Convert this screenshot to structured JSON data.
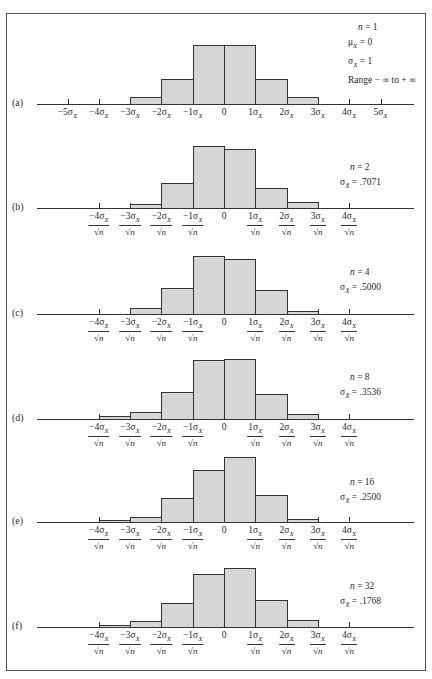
{
  "figure": {
    "frame_color": "#555555",
    "bar_fill": "#d6d6d6",
    "bar_stroke": "#333333",
    "axis_x_start": 37,
    "axis_x_end": 414,
    "zero_x": 224,
    "sigma_px": 31.3
  },
  "chart_data": [
    {
      "type": "bar",
      "panel": "(a)",
      "title": "n = 1",
      "annotations": [
        "n = 1",
        "μX = 0",
        "σX = 1",
        "Range −∞ to +∞"
      ],
      "xlabel": "",
      "ylabel": "",
      "bin_edges_sigma": [
        -3,
        -2,
        -1,
        0,
        1,
        2,
        3
      ],
      "values": [
        7,
        25,
        59,
        59,
        25,
        7
      ],
      "tick_labels": [
        "−5σX",
        "−4σX",
        "−3σX",
        "−2σX",
        "−1σX",
        "0",
        "1σX",
        "2σX",
        "3σX",
        "4σX",
        "5σX"
      ],
      "tick_positions_sigma": [
        -5,
        -4,
        -3,
        -2,
        -1,
        0,
        1,
        2,
        3,
        4,
        5
      ],
      "grid": false
    },
    {
      "type": "bar",
      "panel": "(b)",
      "annotations": [
        "n = 2",
        "σX̄ = .7071"
      ],
      "bin_edges_sigma": [
        -3,
        -2,
        -1,
        0,
        1,
        2,
        3
      ],
      "values": [
        4,
        25,
        62,
        59,
        20,
        6
      ],
      "tick_labels": [
        "−4σX/√n",
        "−3σX/√n",
        "−2σX/√n",
        "−1σX/√n",
        "0",
        "1σX/√n",
        "2σX/√n",
        "3σX/√n",
        "4σX/√n"
      ],
      "tick_positions_sigma": [
        -4,
        -3,
        -2,
        -1,
        0,
        1,
        2,
        3,
        4
      ],
      "grid": false
    },
    {
      "type": "bar",
      "panel": "(c)",
      "annotations": [
        "n = 4",
        "σX̄ = .5000"
      ],
      "bin_edges_sigma": [
        -3,
        -2,
        -1,
        0,
        1,
        2,
        3
      ],
      "values": [
        6,
        26,
        58,
        55,
        24,
        3
      ],
      "tick_labels": [
        "−4σX/√n",
        "−3σX/√n",
        "−2σX/√n",
        "−1σX/√n",
        "0",
        "1σX/√n",
        "2σX/√n",
        "3σX/√n",
        "4σX/√n"
      ],
      "tick_positions_sigma": [
        -4,
        -3,
        -2,
        -1,
        0,
        1,
        2,
        3,
        4
      ],
      "grid": false
    },
    {
      "type": "bar",
      "panel": "(d)",
      "annotations": [
        "n = 8",
        "σX̄ = .3536"
      ],
      "bin_edges_sigma": [
        -4,
        -3,
        -2,
        -1,
        0,
        1,
        2,
        3
      ],
      "values": [
        3,
        7,
        27,
        59,
        60,
        25,
        5
      ],
      "tick_labels": [
        "−4σX/√n",
        "−3σX/√n",
        "−2σX/√n",
        "−1σX/√n",
        "0",
        "1σX/√n",
        "2σX/√n",
        "3σX/√n",
        "4σX/√n"
      ],
      "tick_positions_sigma": [
        -4,
        -3,
        -2,
        -1,
        0,
        1,
        2,
        3,
        4
      ],
      "grid": false
    },
    {
      "type": "bar",
      "panel": "(e)",
      "annotations": [
        "n = 16",
        "σX̄ = .2500"
      ],
      "bin_edges_sigma": [
        -4,
        -3,
        -2,
        -1,
        0,
        1,
        2,
        3
      ],
      "values": [
        2,
        5,
        24,
        52,
        65,
        27,
        3
      ],
      "tick_labels": [
        "−4σX/√n",
        "−3σX/√n",
        "−2σX/√n",
        "−1σX/√n",
        "0",
        "1σX/√n",
        "2σX/√n",
        "3σX/√n",
        "4σX/√n"
      ],
      "tick_positions_sigma": [
        -4,
        -3,
        -2,
        -1,
        0,
        1,
        2,
        3,
        4
      ],
      "grid": false
    },
    {
      "type": "bar",
      "panel": "(f)",
      "annotations": [
        "n = 32",
        "σX̄ = .1768"
      ],
      "bin_edges_sigma": [
        -4,
        -3,
        -2,
        -1,
        0,
        1,
        2,
        3
      ],
      "values": [
        2,
        6,
        24,
        53,
        59,
        27,
        7
      ],
      "tick_labels": [
        "−4σX/√n",
        "−3σX/√n",
        "−2σX/√n",
        "−1σX/√n",
        "0",
        "1σX/√n",
        "2σX/√n",
        "3σX/√n",
        "4σX/√n"
      ],
      "tick_positions_sigma": [
        -4,
        -3,
        -2,
        -1,
        0,
        1,
        2,
        3,
        4
      ],
      "grid": false
    }
  ],
  "panels": [
    {
      "label": "(a)",
      "baseline_y": 104,
      "info_x": 348,
      "info_y": 20,
      "info_style": "full",
      "n_text": "n = 1",
      "mu_text": "= 0",
      "sigma_text": "= 1",
      "range_text": "Range − ∞ to + ∞",
      "sqrt_labels": false
    },
    {
      "label": "(b)",
      "baseline_y": 208,
      "info_x": 340,
      "info_y": 160,
      "info_style": "short",
      "n_text": "n = 2",
      "sigma_text": "= .7071",
      "sqrt_labels": true
    },
    {
      "label": "(c)",
      "baseline_y": 314,
      "info_x": 340,
      "info_y": 265,
      "info_style": "short",
      "n_text": "n = 4",
      "sigma_text": "= .5000",
      "sqrt_labels": true
    },
    {
      "label": "(d)",
      "baseline_y": 419,
      "info_x": 340,
      "info_y": 370,
      "info_style": "short",
      "n_text": "n = 8",
      "sigma_text": "= .3536",
      "sqrt_labels": true
    },
    {
      "label": "(e)",
      "baseline_y": 522,
      "info_x": 340,
      "info_y": 475,
      "info_style": "short",
      "n_text": "n = 16",
      "sigma_text": "= .2500",
      "sqrt_labels": true
    },
    {
      "label": "(f)",
      "baseline_y": 627,
      "info_x": 340,
      "info_y": 579,
      "info_style": "short",
      "n_text": "n = 32",
      "sigma_text": "= .1768",
      "sqrt_labels": true
    }
  ],
  "labels": {
    "sqrt_n": "√n",
    "sigma": "σ",
    "mu": "μ",
    "sub_x": "X",
    "sub_xbar": "X̄"
  }
}
